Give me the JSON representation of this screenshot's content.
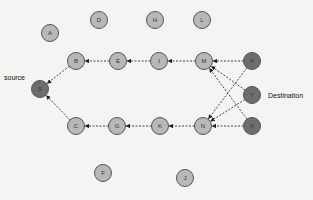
{
  "diagram": {
    "type": "network-routing-graph",
    "labels": {
      "source": "source",
      "destination": "Destination"
    },
    "colors": {
      "background": "#f4f4f2",
      "regular_node_fill": "#b8b8b8",
      "highlight_node_fill": "#6e6e6e",
      "node_stroke": "#555555",
      "edge": "#333333"
    },
    "nodes": [
      {
        "id": "A",
        "label": "A",
        "x": 50,
        "y": 33,
        "kind": "regular"
      },
      {
        "id": "D",
        "label": "D",
        "x": 99,
        "y": 20,
        "kind": "regular"
      },
      {
        "id": "H",
        "label": "H",
        "x": 155,
        "y": 20,
        "kind": "regular"
      },
      {
        "id": "L",
        "label": "L",
        "x": 202,
        "y": 20,
        "kind": "regular"
      },
      {
        "id": "B",
        "label": "B",
        "x": 76,
        "y": 61,
        "kind": "regular"
      },
      {
        "id": "E",
        "label": "E",
        "x": 118,
        "y": 61,
        "kind": "regular"
      },
      {
        "id": "I",
        "label": "I",
        "x": 159,
        "y": 61,
        "kind": "regular"
      },
      {
        "id": "M",
        "label": "M",
        "x": 204,
        "y": 61,
        "kind": "regular"
      },
      {
        "id": "X1",
        "label": "X",
        "x": 252,
        "y": 61,
        "kind": "highlight"
      },
      {
        "id": "S",
        "label": "S",
        "x": 40,
        "y": 89,
        "kind": "highlight"
      },
      {
        "id": "Y",
        "label": "Y",
        "x": 252,
        "y": 95,
        "kind": "highlight"
      },
      {
        "id": "C",
        "label": "C",
        "x": 76,
        "y": 126,
        "kind": "regular"
      },
      {
        "id": "G",
        "label": "G",
        "x": 117,
        "y": 126,
        "kind": "regular"
      },
      {
        "id": "K",
        "label": "K",
        "x": 160,
        "y": 126,
        "kind": "regular"
      },
      {
        "id": "N",
        "label": "N",
        "x": 203,
        "y": 126,
        "kind": "regular"
      },
      {
        "id": "X2",
        "label": "X",
        "x": 252,
        "y": 126,
        "kind": "highlight"
      },
      {
        "id": "F",
        "label": "F",
        "x": 103,
        "y": 173,
        "kind": "regular"
      },
      {
        "id": "J",
        "label": "J",
        "x": 185,
        "y": 178,
        "kind": "regular"
      }
    ],
    "edges": [
      {
        "from": "E",
        "to": "B"
      },
      {
        "from": "I",
        "to": "E"
      },
      {
        "from": "M",
        "to": "I"
      },
      {
        "from": "X1",
        "to": "M"
      },
      {
        "from": "Y",
        "to": "M"
      },
      {
        "from": "X2",
        "to": "M"
      },
      {
        "from": "X1",
        "to": "N"
      },
      {
        "from": "Y",
        "to": "N"
      },
      {
        "from": "X2",
        "to": "N"
      },
      {
        "from": "N",
        "to": "K"
      },
      {
        "from": "K",
        "to": "G"
      },
      {
        "from": "G",
        "to": "C"
      },
      {
        "from": "B",
        "to": "S"
      },
      {
        "from": "C",
        "to": "S"
      }
    ]
  }
}
